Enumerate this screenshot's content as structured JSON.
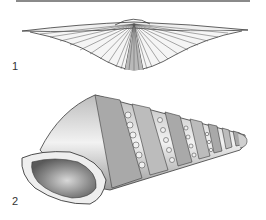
{
  "plate": {
    "figures": [
      {
        "label": "1",
        "subject": "winged brachiopod shell (ribbed, wide hinge line)"
      },
      {
        "label": "2",
        "subject": "turreted gastropod shell with nodular spiral cords"
      }
    ]
  },
  "colors": {
    "ink": "#3a3a3a",
    "rule": "#8a8a8a",
    "paper": "#ffffff"
  }
}
